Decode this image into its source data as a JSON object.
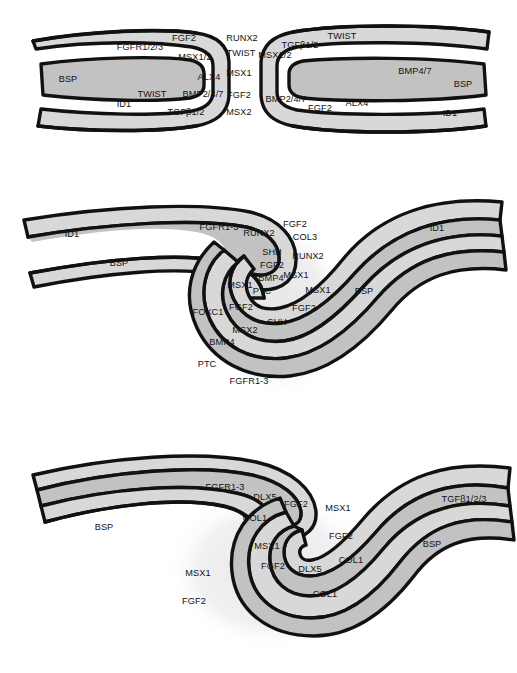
{
  "figure": {
    "type": "scientific-diagram",
    "colors": {
      "outline": "#111111",
      "band_light": "#d8d8d8",
      "band_dark": "#c2c2c2",
      "halo": "#ececec",
      "background": "#ffffff",
      "label_text": "#121212"
    }
  },
  "panels": [
    {
      "id": "panel-top",
      "name": "stage-1-butt-end-suture",
      "labels": [
        {
          "text": "FGFR1/2/3",
          "x": 140,
          "y": 47
        },
        {
          "text": "FGF2",
          "x": 184,
          "y": 38
        },
        {
          "text": "MSX1/2",
          "x": 195,
          "y": 57
        },
        {
          "text": "ALX4",
          "x": 209,
          "y": 77
        },
        {
          "text": "BSP",
          "x": 68,
          "y": 79
        },
        {
          "text": "TWIST",
          "x": 152,
          "y": 94
        },
        {
          "text": "BMP2/4/7",
          "x": 203,
          "y": 94
        },
        {
          "text": "ID1",
          "x": 124,
          "y": 104
        },
        {
          "text": "TGFβ1/2",
          "x": 186,
          "y": 112
        },
        {
          "text": "RUNX2",
          "x": 242,
          "y": 38
        },
        {
          "text": "TWIST",
          "x": 241,
          "y": 53
        },
        {
          "text": "MSX1",
          "x": 239,
          "y": 73
        },
        {
          "text": "FGF2",
          "x": 239,
          "y": 95
        },
        {
          "text": "MSX2",
          "x": 239,
          "y": 112
        },
        {
          "text": "MSX1/2",
          "x": 275,
          "y": 55
        },
        {
          "text": "TGFβ1/2",
          "x": 300,
          "y": 45
        },
        {
          "text": "TWIST",
          "x": 342,
          "y": 36
        },
        {
          "text": "BMP2/4/7",
          "x": 286,
          "y": 99
        },
        {
          "text": "FGF2",
          "x": 320,
          "y": 108
        },
        {
          "text": "ALX4",
          "x": 357,
          "y": 103
        },
        {
          "text": "BMP4/7",
          "x": 415,
          "y": 71
        },
        {
          "text": "BSP",
          "x": 463,
          "y": 84
        },
        {
          "text": "ID1",
          "x": 450,
          "y": 113
        }
      ]
    },
    {
      "id": "panel-middle",
      "name": "stage-2-interdigitating-suture",
      "labels": [
        {
          "text": "ID1",
          "x": 72,
          "y": 234
        },
        {
          "text": "FGFR1-3",
          "x": 219,
          "y": 227
        },
        {
          "text": "RUNX2",
          "x": 259,
          "y": 233
        },
        {
          "text": "FGF2",
          "x": 295,
          "y": 224
        },
        {
          "text": "COL3",
          "x": 305,
          "y": 237
        },
        {
          "text": "BSP",
          "x": 119,
          "y": 263
        },
        {
          "text": "SHH",
          "x": 272,
          "y": 252
        },
        {
          "text": "RUNX2",
          "x": 308,
          "y": 256
        },
        {
          "text": "FGF2",
          "x": 272,
          "y": 265
        },
        {
          "text": "BMP4",
          "x": 271,
          "y": 278
        },
        {
          "text": "MSX1",
          "x": 296,
          "y": 275
        },
        {
          "text": "MSX1",
          "x": 240,
          "y": 285
        },
        {
          "text": "PTC",
          "x": 262,
          "y": 291
        },
        {
          "text": "MSX1",
          "x": 318,
          "y": 290
        },
        {
          "text": "BSP",
          "x": 364,
          "y": 291
        },
        {
          "text": "FOXC1",
          "x": 208,
          "y": 312
        },
        {
          "text": "FGF2",
          "x": 241,
          "y": 307
        },
        {
          "text": "FGF2",
          "x": 304,
          "y": 308
        },
        {
          "text": "SHH",
          "x": 277,
          "y": 322
        },
        {
          "text": "MSX2",
          "x": 245,
          "y": 330
        },
        {
          "text": "BMP4",
          "x": 222,
          "y": 342
        },
        {
          "text": "PTC",
          "x": 207,
          "y": 364
        },
        {
          "text": "FGFR1-3",
          "x": 249,
          "y": 381
        },
        {
          "text": "ID1",
          "x": 437,
          "y": 228
        }
      ]
    },
    {
      "id": "panel-bottom",
      "name": "stage-3-fusing-suture",
      "labels": [
        {
          "text": "FGFR1-3",
          "x": 225,
          "y": 487
        },
        {
          "text": "DLX5",
          "x": 265,
          "y": 497
        },
        {
          "text": "FGF2",
          "x": 296,
          "y": 504
        },
        {
          "text": "MSX1",
          "x": 338,
          "y": 508
        },
        {
          "text": "TGFβ1/2/3",
          "x": 464,
          "y": 499
        },
        {
          "text": "COL1",
          "x": 255,
          "y": 518
        },
        {
          "text": "BSP",
          "x": 104,
          "y": 527
        },
        {
          "text": "FGF2",
          "x": 341,
          "y": 536
        },
        {
          "text": "BSP",
          "x": 432,
          "y": 544
        },
        {
          "text": "MSX1",
          "x": 267,
          "y": 546
        },
        {
          "text": "COL1",
          "x": 351,
          "y": 560
        },
        {
          "text": "MSX1",
          "x": 198,
          "y": 573
        },
        {
          "text": "FGF2",
          "x": 273,
          "y": 566
        },
        {
          "text": "DLX5",
          "x": 310,
          "y": 569
        },
        {
          "text": "COL1",
          "x": 325,
          "y": 594
        },
        {
          "text": "FGF2",
          "x": 194,
          "y": 601
        }
      ]
    }
  ]
}
